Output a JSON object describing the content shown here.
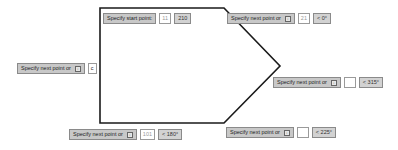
{
  "polygon": {
    "stroke_color": "#1a1a1a",
    "points": "100,8 224,8 280,66 224,123 100,123"
  },
  "tooltips": [
    {
      "id": "start",
      "prompt": "Specify start point:",
      "has_dropdown": false,
      "input": "11",
      "value": "210"
    },
    {
      "id": "p1",
      "prompt": "Specify next point or",
      "has_dropdown": true,
      "dropdown_glyph": "↓",
      "input": "21",
      "value": "< 0°"
    },
    {
      "id": "p2",
      "prompt": "Specify next point or",
      "has_dropdown": true,
      "dropdown_glyph": "↓",
      "input": "",
      "value": "< 315°"
    },
    {
      "id": "p3",
      "prompt": "Specify next point or",
      "has_dropdown": true,
      "dropdown_glyph": "↓",
      "input": "",
      "value": "< 225°"
    },
    {
      "id": "p4",
      "prompt": "Specify next point or",
      "has_dropdown": true,
      "dropdown_glyph": "↓",
      "input": "101",
      "value": "< 180°"
    },
    {
      "id": "p5",
      "prompt": "Specify next point or",
      "has_dropdown": true,
      "dropdown_glyph": "↓",
      "input": "c",
      "value": ""
    }
  ]
}
